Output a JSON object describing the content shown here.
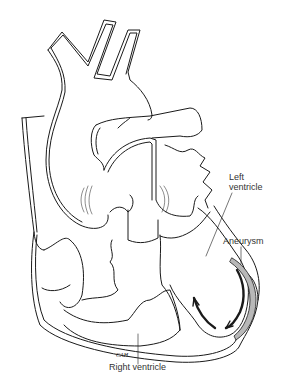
{
  "diagram": {
    "labels": {
      "left_ventricle": [
        "Left",
        "ventricle"
      ],
      "aneurysm": "Aneurysm",
      "right_ventricle": "Right ventricle"
    },
    "signature": "CAH",
    "colors": {
      "line": "#1a1a1a",
      "aneurysm_fill": "#b8b8b8",
      "background": "#ffffff"
    }
  }
}
